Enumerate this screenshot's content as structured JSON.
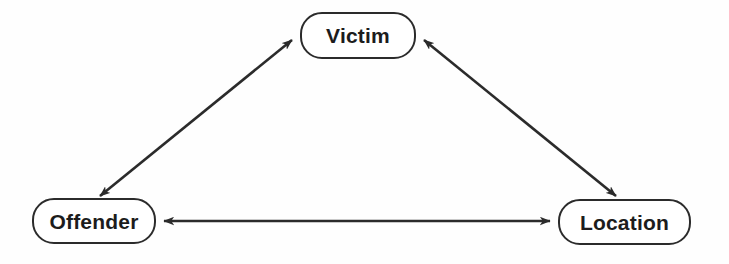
{
  "diagram": {
    "type": "node-link-diagram",
    "background_color": "#fefefe",
    "stroke_color": "#2b2b2b",
    "text_color": "#1c1c1c",
    "nodes": [
      {
        "id": "victim",
        "label": "Victim",
        "position": "top-center",
        "x": 300,
        "y": 12,
        "width": 116,
        "height": 47
      },
      {
        "id": "offender",
        "label": "Offender",
        "position": "bottom-left",
        "x": 32,
        "y": 198,
        "width": 124,
        "height": 46
      },
      {
        "id": "location",
        "label": "Location",
        "position": "bottom-right",
        "x": 558,
        "y": 199,
        "width": 133,
        "height": 46
      }
    ],
    "edges": [
      {
        "id": "offender-victim",
        "from": "offender",
        "to": "victim",
        "direction": "bidirectional",
        "style": "solid"
      },
      {
        "id": "victim-location",
        "from": "victim",
        "to": "location",
        "direction": "bidirectional",
        "style": "solid"
      },
      {
        "id": "offender-location",
        "from": "offender",
        "to": "location",
        "direction": "bidirectional",
        "style": "solid"
      }
    ]
  }
}
